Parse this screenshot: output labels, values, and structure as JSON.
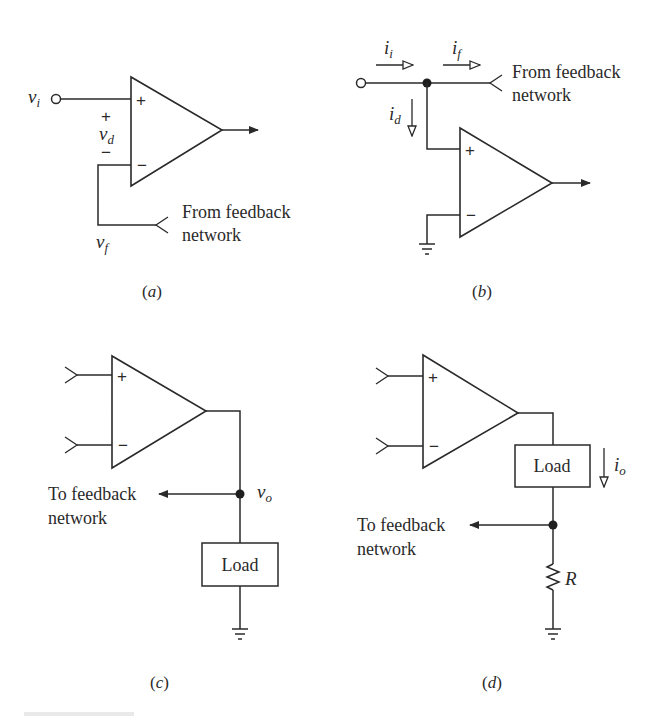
{
  "figure": {
    "colors": {
      "ink": "#2a2a2a",
      "background": "#ffffff"
    },
    "panels": [
      {
        "id": "a",
        "caption": {
          "open": "(",
          "letter": "a",
          "close": ")"
        },
        "input_label": {
          "base": "v",
          "sub": "i"
        },
        "diff_voltage_label": {
          "base": "v",
          "sub": "d",
          "plus": "+",
          "minus": "−"
        },
        "feedback_label": {
          "base": "v",
          "sub": "f"
        },
        "opamp_signs": {
          "plus": "+",
          "minus": "−"
        },
        "feedback_text": [
          "From feedback",
          "network"
        ]
      },
      {
        "id": "b",
        "caption": {
          "open": "(",
          "letter": "b",
          "close": ")"
        },
        "currents": [
          {
            "base": "i",
            "sub": "i"
          },
          {
            "base": "i",
            "sub": "f"
          },
          {
            "base": "i",
            "sub": "d"
          }
        ],
        "opamp_signs": {
          "plus": "+",
          "minus": "−"
        },
        "feedback_text": [
          "From feedback",
          "network"
        ]
      },
      {
        "id": "c",
        "caption": {
          "open": "(",
          "letter": "c",
          "close": ")"
        },
        "output_label": {
          "base": "v",
          "sub": "o"
        },
        "opamp_signs": {
          "plus": "+",
          "minus": "−"
        },
        "load_label": "Load",
        "feedback_text": [
          "To feedback",
          "network"
        ]
      },
      {
        "id": "d",
        "caption": {
          "open": "(",
          "letter": "d",
          "close": ")"
        },
        "current_label": {
          "base": "i",
          "sub": "o"
        },
        "opamp_signs": {
          "plus": "+",
          "minus": "−"
        },
        "load_label": "Load",
        "resistor_label": "R",
        "feedback_text": [
          "To feedback",
          "network"
        ]
      }
    ]
  }
}
